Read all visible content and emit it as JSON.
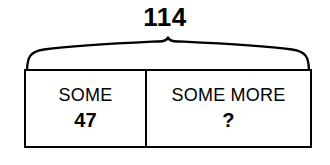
{
  "diagram": {
    "type": "bar-model",
    "total": {
      "label": "114",
      "brace_icon": "curly-brace-icon"
    },
    "parts": [
      {
        "label": "SOME",
        "value": "47"
      },
      {
        "label": "SOME MORE",
        "value": "?"
      }
    ],
    "colors": {
      "stroke": "#000000",
      "background": "#ffffff",
      "text": "#000000"
    }
  }
}
